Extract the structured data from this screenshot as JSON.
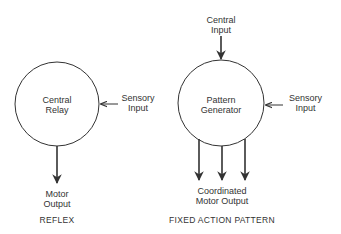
{
  "reflex": {
    "node_label_1": "Central",
    "node_label_2": "Relay",
    "input_label_1": "Sensory",
    "input_label_2": "Input",
    "output_label_1": "Motor",
    "output_label_2": "Output",
    "caption": "REFLEX"
  },
  "fixed_action": {
    "top_input_label_1": "Central",
    "top_input_label_2": "Input",
    "node_label_1": "Pattern",
    "node_label_2": "Generator",
    "input_label_1": "Sensory",
    "input_label_2": "Input",
    "output_label_1": "Coordinated",
    "output_label_2": "Motor Output",
    "caption": "FIXED ACTION PATTERN"
  },
  "colors": {
    "stroke": "#333333",
    "text": "#333333",
    "background": "#ffffff"
  }
}
